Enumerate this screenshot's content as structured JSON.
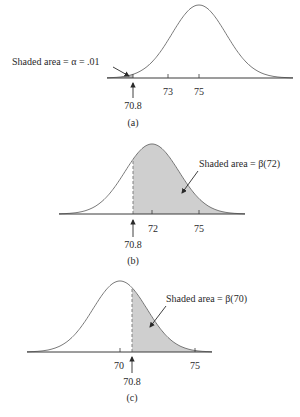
{
  "chart_data": [
    {
      "type": "area",
      "panel": "(a)",
      "title": "",
      "xlabel": "",
      "ylabel": "",
      "distribution": "normal",
      "mean": 75,
      "critical_value": 70.8,
      "tick_labels": [
        "70.8",
        "73",
        "75"
      ],
      "shaded_region": "left tail (x < 70.8)",
      "annotation": "Shaded area = α = .01",
      "caption": "(a)"
    },
    {
      "type": "area",
      "panel": "(b)",
      "distribution": "normal",
      "mean": 72,
      "critical_value": 70.8,
      "tick_labels": [
        "70.8",
        "72",
        "75"
      ],
      "shaded_region": "right of 70.8",
      "annotation": "Shaded area = β(72)",
      "caption": "(b)"
    },
    {
      "type": "area",
      "panel": "(c)",
      "distribution": "normal",
      "mean": 70,
      "critical_value": 70.8,
      "tick_labels": [
        "70",
        "70.8",
        "75"
      ],
      "shaded_region": "right of 70.8",
      "annotation": "Shaded area = β(70)",
      "caption": "(c)"
    }
  ],
  "panels": {
    "a": {
      "annotation": "Shaded area = α = .01",
      "ticks": [
        "73",
        "75"
      ],
      "critical": "70.8",
      "caption": "(a)"
    },
    "b": {
      "annotation": "Shaded area = β(72)",
      "ticks": [
        "72",
        "75"
      ],
      "critical": "70.8",
      "caption": "(b)"
    },
    "c": {
      "annotation": "Shaded area = β(70)",
      "ticks": [
        "70",
        "75"
      ],
      "critical": "70.8",
      "caption": "(c)"
    }
  },
  "colors": {
    "curve": "#6a6a6a",
    "shade": "#cfcfcf",
    "axis": "#3a3a3a"
  }
}
